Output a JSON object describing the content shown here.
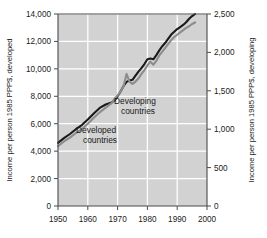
{
  "chart_data": {
    "type": "line",
    "title": "",
    "subtitle": "",
    "xlabel": "",
    "ylabel": "Income per person 1985 PPP$, developed",
    "y2label": "Income per person 1985 PPP$, developing",
    "grid": true,
    "legend_position": "inline-annotations",
    "xlim": [
      1950,
      2000
    ],
    "ylim": [
      0,
      14000
    ],
    "y2lim": [
      0,
      2500
    ],
    "x_ticks": [
      "1950",
      "1960",
      "1970",
      "1980",
      "1990",
      "2000"
    ],
    "x_tick_values": [
      1950,
      1960,
      1970,
      1980,
      1990,
      2000
    ],
    "y_ticks": [
      "0",
      "2,000",
      "4,000",
      "6,000",
      "8,000",
      "10,000",
      "12,000",
      "14,000"
    ],
    "y_tick_values": [
      0,
      2000,
      4000,
      6000,
      8000,
      10000,
      12000,
      14000
    ],
    "y2_ticks": [
      "0",
      "500",
      "1,000",
      "1,500",
      "2,000",
      "2,500"
    ],
    "y2_tick_values": [
      0,
      500,
      1000,
      1500,
      2000,
      2500
    ],
    "series": [
      {
        "name": "Developed countries",
        "axis": "left",
        "color": "#1a1a1a",
        "stroke_width": 2.1,
        "x": [
          1950,
          1952,
          1954,
          1956,
          1958,
          1960,
          1962,
          1964,
          1966,
          1968,
          1969,
          1970,
          1971,
          1972,
          1973,
          1974,
          1975,
          1976,
          1977,
          1978,
          1979,
          1980,
          1981,
          1982,
          1983,
          1984,
          1985,
          1986,
          1987,
          1988,
          1989,
          1990,
          1991,
          1992,
          1993,
          1994,
          1995,
          1996
        ],
        "values": [
          4600,
          4950,
          5250,
          5600,
          5900,
          6300,
          6750,
          7150,
          7400,
          7550,
          7700,
          8000,
          8350,
          8750,
          9050,
          9150,
          9200,
          9500,
          9800,
          10050,
          10350,
          10700,
          10750,
          10700,
          11000,
          11350,
          11650,
          11900,
          12200,
          12500,
          12700,
          12900,
          13050,
          13200,
          13400,
          13650,
          13850,
          14000
        ]
      },
      {
        "name": "Developing countries",
        "axis": "right",
        "color": "#8c8c8c",
        "stroke_width": 2.1,
        "x": [
          1950,
          1952,
          1954,
          1956,
          1958,
          1960,
          1962,
          1964,
          1966,
          1968,
          1969,
          1970,
          1971,
          1972,
          1973,
          1974,
          1975,
          1976,
          1977,
          1978,
          1979,
          1980,
          1981,
          1982,
          1983,
          1984,
          1985,
          1986,
          1987,
          1988,
          1989,
          1990,
          1991,
          1992,
          1993,
          1994,
          1995,
          1996
        ],
        "values": [
          780,
          840,
          890,
          950,
          1000,
          1070,
          1150,
          1220,
          1280,
          1340,
          1400,
          1440,
          1490,
          1560,
          1720,
          1620,
          1590,
          1620,
          1660,
          1720,
          1770,
          1830,
          1880,
          1840,
          1890,
          1960,
          2010,
          2060,
          2110,
          2160,
          2200,
          2230,
          2260,
          2290,
          2320,
          2340,
          2370,
          2390
        ]
      }
    ],
    "annotations": [
      {
        "text_line1": "Developing",
        "text_line2": "countries",
        "x": 1977,
        "y": 7250
      },
      {
        "text_line1": "Developed",
        "text_line2": "countries",
        "x": 1967,
        "y": 5250
      }
    ]
  },
  "axes": {
    "left_title": "Income per person 1985 PPP$, developed",
    "right_title": "Income per person 1985 PPP$, developing"
  },
  "annotations": {
    "developing_line1": "Developing",
    "developing_line2": "countries",
    "developed_line1": "Developed",
    "developed_line2": "countries"
  },
  "colors": {
    "developed_line": "#1a1a1a",
    "developing_line": "#8c8c8c",
    "plot_background": "#d2d2d2",
    "gridline": "#ffffff",
    "axis": "#4a4a4a",
    "page_background": "#ffffff"
  }
}
